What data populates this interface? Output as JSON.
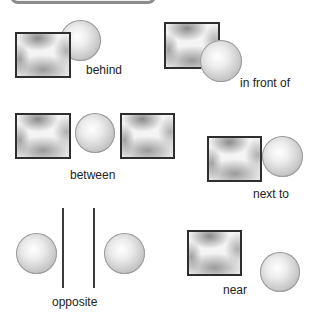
{
  "diagram": {
    "panels": [
      {
        "id": "behind",
        "label": "behind"
      },
      {
        "id": "in-front-of",
        "label": "in front of"
      },
      {
        "id": "between",
        "label": "between"
      },
      {
        "id": "next-to",
        "label": "next to"
      },
      {
        "id": "opposite",
        "label": "opposite"
      },
      {
        "id": "near",
        "label": "near"
      }
    ]
  }
}
